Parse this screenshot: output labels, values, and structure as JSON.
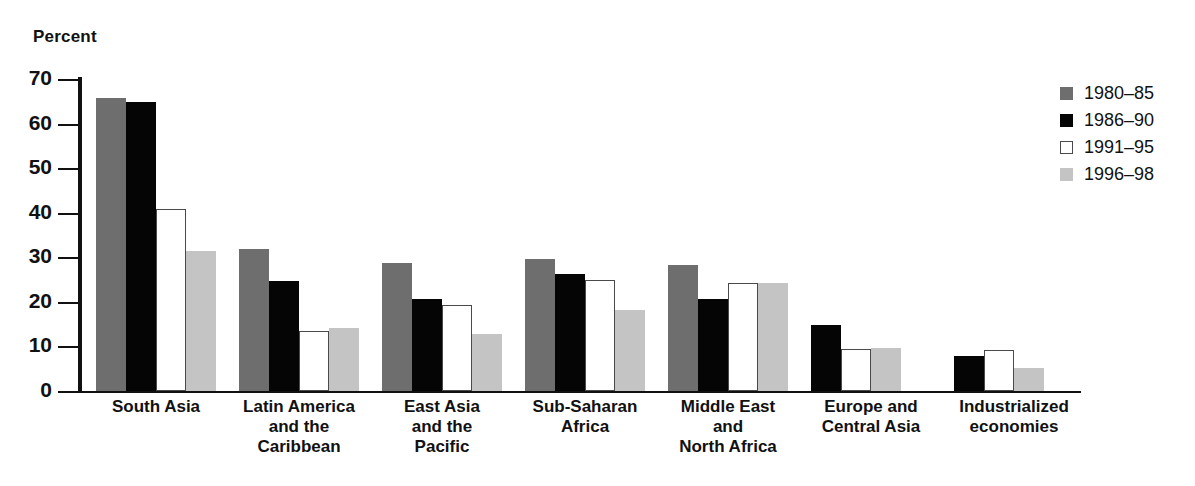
{
  "axis": {
    "y_title": "Percent",
    "ticks": [
      0,
      10,
      20,
      30,
      40,
      50,
      60,
      70
    ]
  },
  "legend": {
    "items": [
      {
        "label": "1980–85",
        "color": "#6e6e6e",
        "style": "filled"
      },
      {
        "label": "1986–90",
        "color": "#050505",
        "style": "filled"
      },
      {
        "label": "1991–95",
        "color": "#ffffff",
        "style": "outlined"
      },
      {
        "label": "1996–98",
        "color": "#c4c4c4",
        "style": "filled"
      }
    ]
  },
  "chart_data": {
    "type": "bar",
    "title": "",
    "xlabel": "",
    "ylabel": "Percent",
    "ylim": [
      0,
      70
    ],
    "ytick_step": 10,
    "grid": false,
    "legend_position": "right",
    "categories": [
      "South Asia",
      "Latin America\nand the\nCaribbean",
      "East Asia\nand the\nPacific",
      "Sub-Saharan\nAfrica",
      "Middle East\nand\nNorth Africa",
      "Europe and\nCentral Asia",
      "Industrialized\neconomies"
    ],
    "series": [
      {
        "name": "1980–85",
        "color": "#6e6e6e",
        "values": [
          65.7,
          31.8,
          28.8,
          29.6,
          28.2,
          null,
          null
        ]
      },
      {
        "name": "1986–90",
        "color": "#050505",
        "values": [
          64.9,
          24.6,
          20.7,
          26.3,
          20.6,
          14.9,
          7.9
        ]
      },
      {
        "name": "1991–95",
        "color": "#ffffff",
        "values": [
          40.8,
          13.5,
          19.4,
          24.9,
          24.2,
          9.4,
          9.3
        ]
      },
      {
        "name": "1996–98",
        "color": "#c4c4c4",
        "values": [
          31.4,
          14.2,
          12.9,
          18.2,
          24.2,
          9.6,
          5.2
        ]
      }
    ]
  }
}
